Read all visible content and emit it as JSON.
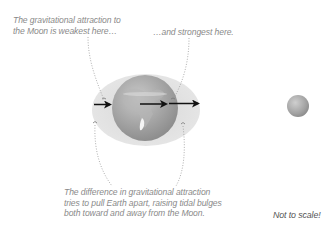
{
  "labels": {
    "weakest": [
      "The gravitational attraction to",
      "the Moon is weakest here…"
    ],
    "strongest": "…and strongest here.",
    "difference": [
      "The difference in gravitational attraction",
      "tries to pull Earth apart, raising tidal bulges",
      "both toward and away from the Moon."
    ],
    "not_to_scale": "Not to scale!"
  },
  "objects": {
    "earth": {
      "name": "Earth",
      "color": "#9a9a9a"
    },
    "tidal_bulge": {
      "name": "Tidal bulge",
      "color": "#dcdcdc"
    },
    "moon": {
      "name": "Moon",
      "color": "#a0a0a0"
    }
  },
  "arrows": [
    {
      "name": "force-far-side",
      "length": "short"
    },
    {
      "name": "force-center",
      "length": "medium"
    },
    {
      "name": "force-near-side",
      "length": "long"
    }
  ],
  "colors": {
    "text": "#8a8a8a",
    "arrow": "#111111",
    "leader": "#9a9a9a"
  }
}
